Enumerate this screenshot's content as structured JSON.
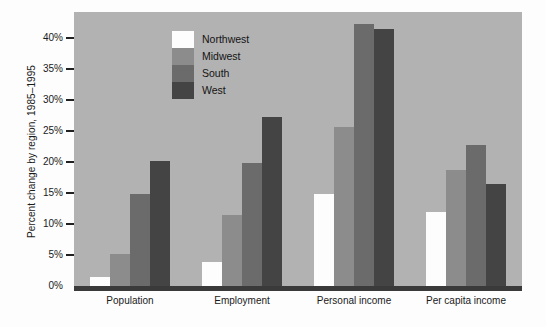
{
  "chart_data": {
    "type": "bar",
    "title": "",
    "xlabel": "",
    "ylabel": "Percent change by region, 1985–1995",
    "categories": [
      "Population",
      "Employment",
      "Personal income",
      "Per capita income"
    ],
    "series": [
      {
        "name": "Northwest",
        "color": "#fdfdfd",
        "values": [
          2.3,
          4.7,
          15.6,
          12.8
        ]
      },
      {
        "name": "Midwest",
        "color": "#8c8c8c",
        "values": [
          6.0,
          12.2,
          26.5,
          19.5
        ]
      },
      {
        "name": "South",
        "color": "#6b6b6b",
        "values": [
          15.7,
          20.7,
          43.0,
          23.5
        ]
      },
      {
        "name": "West",
        "color": "#444444",
        "values": [
          21.0,
          28.0,
          42.2,
          17.3
        ]
      }
    ],
    "ytick_labels": [
      "0%",
      "5%",
      "10%",
      "15%",
      "20%",
      "25%",
      "30%",
      "35%",
      "40%"
    ],
    "ytick_values": [
      0,
      5,
      10,
      15,
      20,
      25,
      30,
      35,
      40
    ],
    "ylim": [
      0,
      45
    ],
    "grid": false,
    "legend_position": "top-left-inside",
    "plot_background": "#b2b2b2",
    "axis_color": "#3a3a3a"
  },
  "legend": {
    "items": [
      {
        "label": "Northwest"
      },
      {
        "label": "Midwest"
      },
      {
        "label": "South"
      },
      {
        "label": "West"
      }
    ]
  }
}
